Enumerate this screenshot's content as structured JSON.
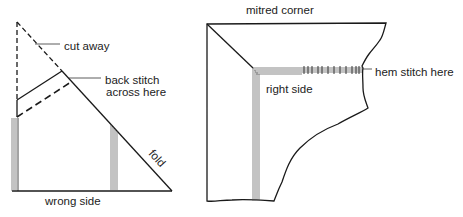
{
  "left_figure": {
    "labels": {
      "cut_away": "cut away",
      "back_stitch_line1": "back stitch",
      "back_stitch_line2": "across here",
      "fold": "fold",
      "wrong_side": "wrong side"
    }
  },
  "right_figure": {
    "labels": {
      "title": "mitred corner",
      "right_side": "right side",
      "hem_stitch": "hem stitch here"
    }
  },
  "colors": {
    "line": "#1a1a1a",
    "text": "#222222",
    "background": "#ffffff"
  }
}
